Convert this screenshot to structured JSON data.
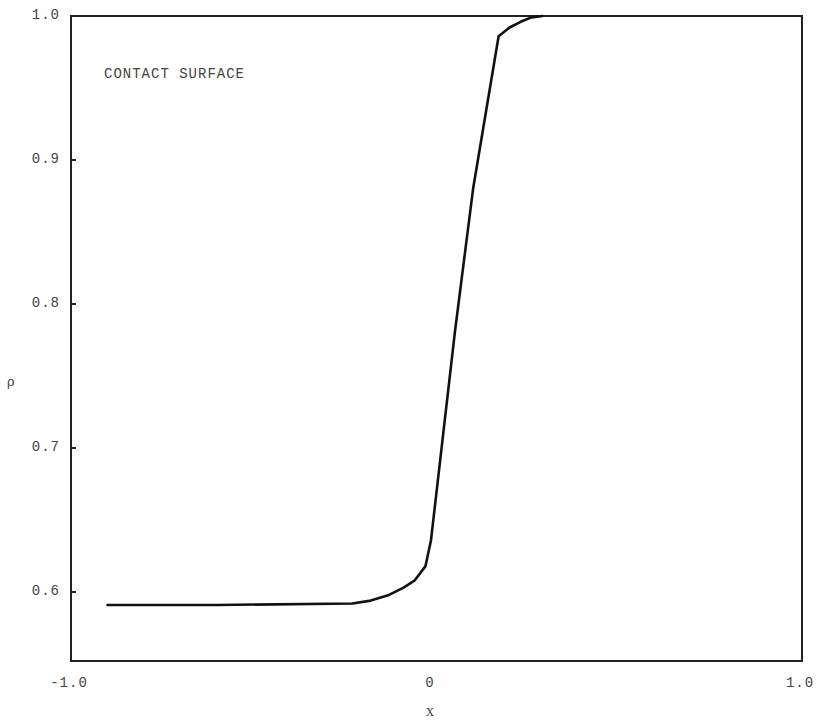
{
  "chart_data": {
    "type": "line",
    "title": "",
    "annotation": "CONTACT SURFACE",
    "xlabel": "x",
    "ylabel": "ρ",
    "xlim": [
      -1.0,
      1.0
    ],
    "ylim": [
      0.555,
      1.0
    ],
    "grid": false,
    "legend": null,
    "x_ticks": [
      "-1.0",
      "0",
      "1.0"
    ],
    "y_ticks": [
      "1.0",
      "0.9",
      "0.8",
      "0.7",
      "0.6"
    ],
    "series": [
      {
        "name": "density",
        "x": [
          -0.9,
          -0.6,
          -0.23,
          -0.18,
          -0.13,
          -0.09,
          -0.06,
          -0.03,
          -0.015,
          0.05,
          0.1,
          0.17,
          0.2,
          0.23,
          0.26,
          0.29
        ],
        "y": [
          0.591,
          0.591,
          0.592,
          0.594,
          0.598,
          0.603,
          0.608,
          0.618,
          0.636,
          0.78,
          0.88,
          0.986,
          0.992,
          0.996,
          0.999,
          1.0
        ]
      }
    ]
  }
}
